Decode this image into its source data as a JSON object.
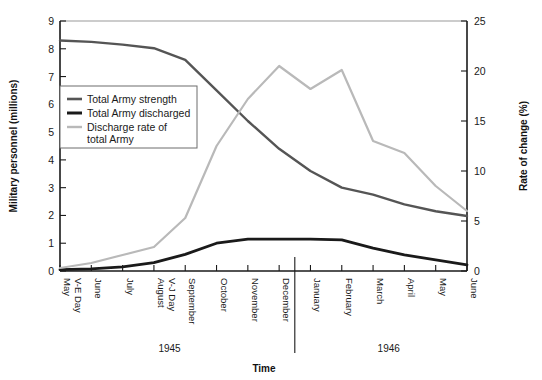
{
  "chart_data": {
    "type": "line",
    "title": "",
    "xlabel": "Time",
    "ylabel": "Military personnel (millions)",
    "y2label": "Rate of change (%)",
    "ylim": [
      0,
      9
    ],
    "y2lim": [
      0,
      25
    ],
    "ytick_labels": [
      "0",
      "1",
      "2",
      "3",
      "4",
      "5",
      "6",
      "7",
      "8",
      "9"
    ],
    "y2tick_labels": [
      "0",
      "5",
      "10",
      "15",
      "20",
      "25"
    ],
    "grid": false,
    "legend_position": "upper-left-inside",
    "categories": [
      "May\nV-E Day",
      "June",
      "July",
      "August\nV-J Day",
      "September",
      "October",
      "November",
      "December",
      "January",
      "February",
      "March",
      "April",
      "May",
      "June"
    ],
    "category_lines": [
      [
        "May",
        "V-E Day"
      ],
      [
        "June"
      ],
      [
        "July"
      ],
      [
        "August",
        "V-J Day"
      ],
      [
        "September"
      ],
      [
        "October"
      ],
      [
        "November"
      ],
      [
        "December"
      ],
      [
        "January"
      ],
      [
        "February"
      ],
      [
        "March"
      ],
      [
        "April"
      ],
      [
        "May"
      ],
      [
        "June"
      ]
    ],
    "group_labels": [
      {
        "text": "1945",
        "start_index": 0,
        "end_index": 7
      },
      {
        "text": "1946",
        "start_index": 8,
        "end_index": 13
      }
    ],
    "divider_after_index": 7,
    "series": [
      {
        "name": "Total Army strength",
        "axis": "left",
        "color": "#555555",
        "width": 2.4,
        "units": "millions",
        "values": [
          8.3,
          8.25,
          8.15,
          8.02,
          7.6,
          6.5,
          5.4,
          4.4,
          3.6,
          3.0,
          2.75,
          2.4,
          2.15,
          1.98
        ]
      },
      {
        "name": "Total Army discharged",
        "axis": "left",
        "color": "#1a1a1a",
        "width": 2.8,
        "units": "millions",
        "values": [
          0.05,
          0.08,
          0.15,
          0.3,
          0.6,
          1.0,
          1.15,
          1.15,
          1.15,
          1.12,
          0.82,
          0.58,
          0.4,
          0.22
        ]
      },
      {
        "name": "Discharge rate of total Army",
        "axis": "right",
        "color": "#b9b9b9",
        "width": 2.2,
        "units": "percent",
        "values": [
          0.3,
          0.8,
          1.6,
          2.4,
          5.3,
          12.5,
          17.2,
          20.5,
          18.2,
          20.1,
          13.0,
          11.8,
          8.5,
          6.0
        ]
      }
    ],
    "legend_entries": [
      {
        "label_lines": [
          "Total Army strength"
        ],
        "color": "#555555",
        "width": 2.6
      },
      {
        "label_lines": [
          "Total Army discharged"
        ],
        "color": "#1a1a1a",
        "width": 3.0
      },
      {
        "label_lines": [
          "Discharge rate of",
          "total Army"
        ],
        "color": "#b9b9b9",
        "width": 2.4
      }
    ]
  }
}
